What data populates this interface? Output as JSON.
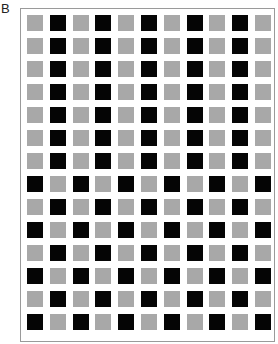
{
  "panel_label": "B",
  "colors": {
    "gray": "#a8a8a8",
    "black": "#050505",
    "frame": "#9a9a9a"
  },
  "grid": {
    "columns": 11,
    "rows": [
      "GBGBGBGBGBG",
      "GBGBGBGBGBG",
      "GBGBGBGBGBG",
      "GBGBGBGBGBG",
      "GBGBGBGBGBG",
      "GBGBGBGBGBG",
      "GBGBGBGBGBG",
      "BGBGBGBGBGB",
      "GBGBGBGBGBG",
      "BGBGBGBGBGB",
      "GBGBGBGBGBG",
      "BGBGBGBGBGB",
      "GBGBGBGBGBG",
      "BGBGBGBGBGB"
    ]
  }
}
